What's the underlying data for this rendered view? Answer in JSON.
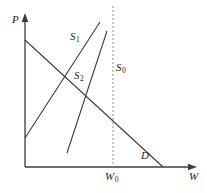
{
  "figure": {
    "background_color": "#ffffff",
    "line_color": "#3c3c3c",
    "dashed_line_color": "#8f8f8f",
    "text_color": "#1e1e1e",
    "labels": {
      "p_axis": {
        "text": "P"
      },
      "w_axis": {
        "text": "W"
      },
      "w0": {
        "main": "W",
        "sub": "0"
      },
      "s0": {
        "main": "S",
        "sub": "0"
      },
      "s1": {
        "main": "S",
        "sub": "1"
      },
      "s2": {
        "main": "S",
        "sub": "2"
      },
      "d": {
        "text": "D"
      }
    },
    "lines": [
      {
        "name": "y-axis",
        "x1": 25,
        "y1": 167,
        "x2": 25,
        "y2": 17,
        "dashed": false,
        "arrow": "up",
        "width": 1.3
      },
      {
        "name": "x-axis",
        "x1": 25,
        "y1": 167,
        "x2": 192,
        "y2": 167,
        "dashed": false,
        "arrow": "right",
        "width": 1.3
      },
      {
        "name": "supply-curve-s1",
        "x1": 25,
        "y1": 138,
        "x2": 100,
        "y2": 22,
        "dashed": false,
        "arrow": "none",
        "width": 1.1
      },
      {
        "name": "supply-curve-s2",
        "x1": 67,
        "y1": 153,
        "x2": 107,
        "y2": 31,
        "dashed": false,
        "arrow": "none",
        "width": 1.1
      },
      {
        "name": "supply-line-s0",
        "x1": 113,
        "y1": 6,
        "x2": 113,
        "y2": 167,
        "dashed": true,
        "arrow": "none",
        "width": 1
      },
      {
        "name": "demand-curve-d",
        "x1": 25,
        "y1": 40,
        "x2": 163,
        "y2": 167,
        "dashed": false,
        "arrow": "none",
        "width": 1.1
      }
    ]
  }
}
